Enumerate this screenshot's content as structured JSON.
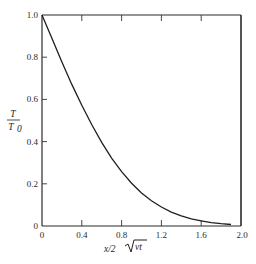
{
  "chart_data": {
    "type": "line",
    "title": "",
    "xlabel": "x/2√(νt)",
    "ylabel": "T/T0",
    "xlim": [
      0,
      2.0
    ],
    "ylim": [
      0,
      1.0
    ],
    "grid": false,
    "legend": null,
    "x_ticks": [
      "0",
      "0.4",
      "0.8",
      "1.2",
      "1.6",
      "2.0"
    ],
    "y_ticks": [
      "0",
      "0.2",
      "0.4",
      "0.6",
      "0.8",
      "1.0"
    ],
    "series": [
      {
        "name": "T/T0 (erfc profile)",
        "x": [
          0,
          0.1,
          0.2,
          0.3,
          0.4,
          0.5,
          0.6,
          0.7,
          0.8,
          0.9,
          1.0,
          1.1,
          1.2,
          1.3,
          1.4,
          1.5,
          1.6,
          1.7,
          1.8,
          1.9
        ],
        "values": [
          1.0,
          0.888,
          0.777,
          0.671,
          0.572,
          0.48,
          0.396,
          0.322,
          0.258,
          0.203,
          0.157,
          0.12,
          0.09,
          0.066,
          0.048,
          0.034,
          0.024,
          0.016,
          0.011,
          0.007
        ]
      }
    ]
  },
  "labels": {
    "x_axis": "x/2",
    "x_axis_sqrt": "νt",
    "y_axis_num": "T",
    "y_axis_den": "T",
    "y_axis_den_sub": "0"
  },
  "colors": {
    "line": "#1f1f1f",
    "axes": "#2b2b2b",
    "background": "#ffffff"
  }
}
